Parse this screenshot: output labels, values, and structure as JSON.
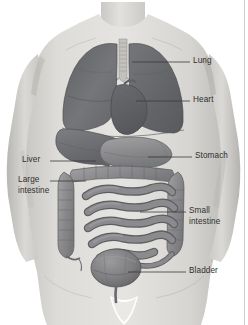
{
  "figure": {
    "kind": "anatomical-diagram",
    "background_color": "#ffffff",
    "line_color": "#3a3a3a",
    "text_color": "#2f2f2f",
    "skin_color": "#d9d7d3",
    "organ_color": "#8d8d8f",
    "organ_dark_color": "#6e6f72"
  },
  "labels": {
    "lung": "Lung",
    "heart": "Heart",
    "stomach": "Stomach",
    "liver": "Liver",
    "large_intestine_line1": "Large",
    "large_intestine_line2": "intestine",
    "small_intestine_line1": "Small",
    "small_intestine_line2": "intestine",
    "bladder": "Bladder"
  },
  "organs": [
    {
      "name": "lung",
      "label": "Lung",
      "side": "right",
      "leader_y": 62
    },
    {
      "name": "heart",
      "label": "Heart",
      "side": "right",
      "leader_y": 101
    },
    {
      "name": "stomach",
      "label": "Stomach",
      "side": "right",
      "leader_y": 157
    },
    {
      "name": "liver",
      "label": "Liver",
      "side": "left",
      "leader_y": 161
    },
    {
      "name": "large-intestine",
      "label": "Large intestine",
      "side": "left",
      "leader_y": 181
    },
    {
      "name": "small-intestine",
      "label": "Small intestine",
      "side": "right",
      "leader_y": 212
    },
    {
      "name": "bladder",
      "label": "Bladder",
      "side": "right",
      "leader_y": 272
    }
  ]
}
